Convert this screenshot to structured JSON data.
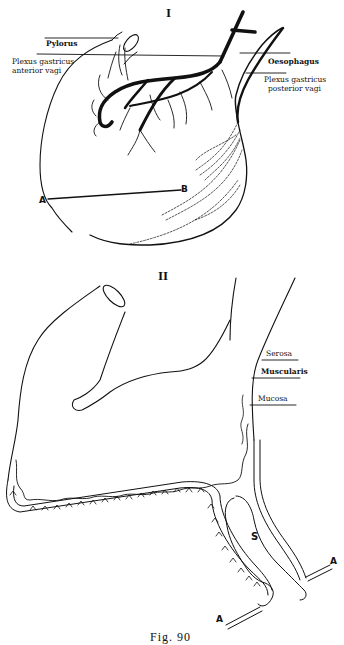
{
  "figure": {
    "caption": "Fig. 90",
    "panels": [
      {
        "id": "I",
        "numeral": "I",
        "labels": {
          "pylorus": "Pylorus",
          "plexus_anterior_1": "Plexus gastricus",
          "plexus_anterior_2": "anterior vagi",
          "oesophagus": "Oesophagus",
          "plexus_posterior_1": "Plexus gastricus",
          "plexus_posterior_2": "posterior vagi",
          "point_a": "A",
          "point_b": "B"
        }
      },
      {
        "id": "II",
        "numeral": "II",
        "labels": {
          "serosa": "Serosa",
          "muscularis": "Muscularis",
          "mucosa": "Mucosa",
          "space": "S",
          "point_a_left": "A",
          "point_a_right": "A"
        }
      }
    ]
  },
  "colors": {
    "ink": "#111111",
    "paper": "#ffffff"
  }
}
